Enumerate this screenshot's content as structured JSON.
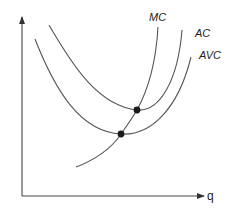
{
  "diagram": {
    "axes": {
      "x_label": "q",
      "y_label": ""
    },
    "curves": [
      {
        "id": "mc",
        "label": "MC",
        "description": "Marginal cost"
      },
      {
        "id": "ac",
        "label": "AC",
        "description": "Average cost"
      },
      {
        "id": "avc",
        "label": "AVC",
        "description": "Average variable cost"
      }
    ],
    "points": [
      {
        "id": "mc-ac-min",
        "description": "MC crosses AC at its minimum"
      },
      {
        "id": "mc-avc-min",
        "description": "MC crosses AVC at its minimum"
      }
    ],
    "colors": {
      "curve": "#555555",
      "axis": "#444444",
      "marker": "#1a1a1a",
      "background": "#ffffff"
    }
  }
}
